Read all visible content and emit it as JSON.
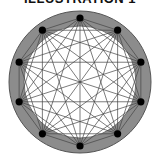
{
  "title": "ILLUSTRATION 1",
  "diagram": {
    "type": "complete-graph",
    "node_count": 10,
    "center": [
      80,
      82
    ],
    "node_radius_px": 64,
    "ring": {
      "outer_radius": 71,
      "inner_radius": 56,
      "fill": "#8c8c8c",
      "stroke": "#555555"
    },
    "inner_fill": "#ffffff",
    "node_color": "#000000",
    "edge_color": "#444444",
    "start_angle_deg": -90
  }
}
